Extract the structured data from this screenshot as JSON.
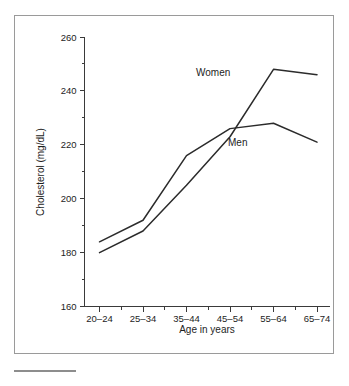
{
  "chart_data": {
    "type": "line",
    "title": "",
    "xlabel": "Age in years",
    "ylabel": "Cholesterol (mg/dL)",
    "categories": [
      "20–24",
      "25–34",
      "35–44",
      "45–54",
      "55–64",
      "65–74"
    ],
    "ylim": [
      160,
      260
    ],
    "ytick_labels": [
      "160",
      "180",
      "200",
      "220",
      "240",
      "260"
    ],
    "ytick_values": [
      160,
      180,
      200,
      220,
      240,
      260
    ],
    "yminor_step": 10,
    "grid": false,
    "legend_position": "inline-annotation",
    "series": [
      {
        "name": "Men",
        "label": "Men",
        "color": "#2b2b2b",
        "values": [
          184,
          192,
          216,
          226,
          228,
          221
        ]
      },
      {
        "name": "Women",
        "label": "Women",
        "color": "#2b2b2b",
        "values": [
          180,
          188,
          205,
          223,
          248,
          246
        ]
      }
    ],
    "annotations": [
      {
        "text": "Women",
        "x_pct": 0.56,
        "y_value": 249
      },
      {
        "text": "Men",
        "x_pct": 0.68,
        "y_value": 227
      }
    ]
  },
  "axis": {
    "y_title": "Cholesterol (mg/dL)",
    "x_title": "Age in years",
    "y_labels": [
      "260",
      "240",
      "220",
      "200",
      "180",
      "160"
    ],
    "x_labels": [
      "20–24",
      "25–34",
      "35–44",
      "45–54",
      "55–64",
      "65–74"
    ]
  },
  "series_labels": {
    "women": "Women",
    "men": "Men"
  },
  "colors": {
    "line": "#2b2b2b",
    "axis": "#3a3a3a",
    "frame": "#9a9a9a",
    "rule": "#8d8d8d",
    "background": "#ffffff",
    "text": "#1d1d1d"
  }
}
